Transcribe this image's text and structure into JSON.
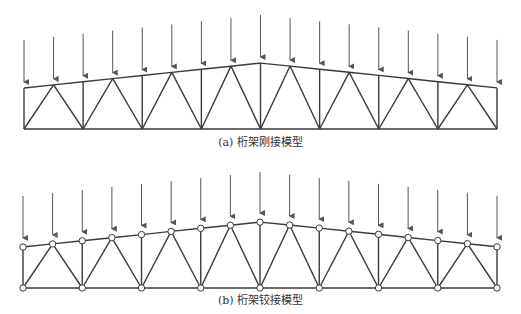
{
  "figures": [
    {
      "id": "rigid",
      "caption": "(a) 桁架刚接模型",
      "joint_type": "rigid",
      "show_joint_circles": false,
      "x_left": 24,
      "x_right": 497,
      "x_center": 261,
      "top_end_y": 88,
      "top_apex_y": 63,
      "bottom_y": 129,
      "arrow_top_end_y": 40,
      "arrow_top_apex_y": 15,
      "caption_y": 140
    },
    {
      "id": "pinned",
      "caption": "(b) 桁架铰接模型",
      "joint_type": "pinned",
      "show_joint_circles": true,
      "x_left": 23,
      "x_right": 497,
      "x_center": 261,
      "top_end_y": 247,
      "top_apex_y": 222,
      "bottom_y": 288,
      "arrow_top_end_y": 196,
      "arrow_top_apex_y": 172,
      "caption_y": 293
    }
  ],
  "truss": {
    "panels": 16,
    "top_nodes": 17,
    "bottom_nodes": 9,
    "loads_per_top_node": true
  },
  "colors": {
    "member": "#3a3a3a",
    "load_arrow": "#555555",
    "joint_fill": "#ffffff",
    "caption": "#333333"
  }
}
